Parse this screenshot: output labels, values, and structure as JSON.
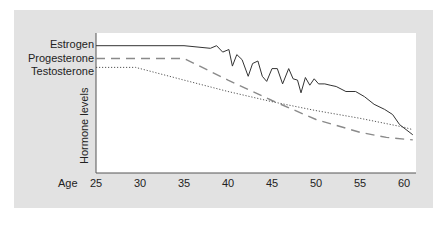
{
  "chart_data": {
    "type": "line",
    "title": "",
    "xlabel": "Age",
    "ylabel": "Hormone levels",
    "xlim": [
      25,
      61
    ],
    "x_ticks": [
      25,
      30,
      35,
      40,
      45,
      50,
      55,
      60
    ],
    "grid": false,
    "legend_position": "left (inline labels at line start)",
    "series": [
      {
        "name": "Estrogen",
        "style": "solid",
        "points": [
          [
            25,
            100
          ],
          [
            35,
            100
          ],
          [
            38,
            98
          ],
          [
            38.7,
            100
          ],
          [
            39.4,
            95
          ],
          [
            40.1,
            97
          ],
          [
            40.5,
            84
          ],
          [
            41,
            93
          ],
          [
            41.6,
            89
          ],
          [
            42.3,
            76
          ],
          [
            42.8,
            86
          ],
          [
            43.4,
            88
          ],
          [
            43.9,
            76
          ],
          [
            44.4,
            72
          ],
          [
            45,
            82
          ],
          [
            45.6,
            82
          ],
          [
            46.2,
            70
          ],
          [
            46.9,
            82
          ],
          [
            47.4,
            74
          ],
          [
            47.9,
            73
          ],
          [
            48.3,
            63
          ],
          [
            48.8,
            75
          ],
          [
            49.3,
            69
          ],
          [
            49.8,
            74
          ],
          [
            50.3,
            70
          ],
          [
            51,
            70
          ],
          [
            51.6,
            69
          ],
          [
            52.3,
            68
          ],
          [
            53.4,
            64
          ],
          [
            54.5,
            64
          ],
          [
            55.5,
            60
          ],
          [
            56.6,
            54
          ],
          [
            57.8,
            50
          ],
          [
            58.7,
            46
          ],
          [
            59.5,
            38
          ],
          [
            61,
            30
          ]
        ]
      },
      {
        "name": "Progesterone",
        "style": "dashed",
        "points": [
          [
            25,
            90
          ],
          [
            35,
            90
          ],
          [
            40,
            73
          ],
          [
            45,
            57
          ],
          [
            50,
            42
          ],
          [
            55,
            32
          ],
          [
            58,
            28
          ],
          [
            61,
            26
          ]
        ]
      },
      {
        "name": "Testosterone",
        "style": "dotted",
        "points": [
          [
            25,
            83
          ],
          [
            29.5,
            83
          ],
          [
            35,
            73
          ],
          [
            40,
            64
          ],
          [
            45,
            56
          ],
          [
            50,
            49
          ],
          [
            55,
            43
          ],
          [
            60,
            36
          ],
          [
            61,
            34
          ]
        ]
      }
    ],
    "ylim": [
      0,
      110
    ],
    "y_ticks": []
  },
  "labels": {
    "estrogen": "Estrogen",
    "progesterone": "Progesterone",
    "testosterone": "Testosterone",
    "ylabel": "Hormone levels",
    "xlabel": "Age",
    "xticks": [
      "25",
      "30",
      "35",
      "40",
      "45",
      "50",
      "55",
      "60"
    ]
  },
  "colors": {
    "panel": "#e2e2e2",
    "plot": "#ffffff",
    "line": "#333333",
    "dashed": "#8a8a8a",
    "axis": "#555555"
  }
}
